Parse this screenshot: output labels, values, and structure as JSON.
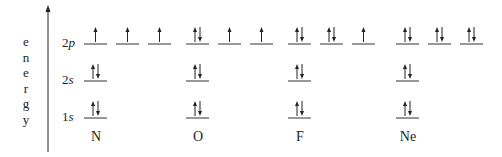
{
  "axis_label": [
    "e",
    "n",
    "e",
    "r",
    "g",
    "y"
  ],
  "levels": [
    {
      "num": "2",
      "sub": "p",
      "y": 44
    },
    {
      "num": "2",
      "sub": "s",
      "y": 81
    },
    {
      "num": "1",
      "sub": "s",
      "y": 118
    }
  ],
  "elements": [
    {
      "symbol": "N",
      "x": 84,
      "config": {
        "1s": [
          "ud"
        ],
        "2s": [
          "ud"
        ],
        "2p": [
          "u",
          "u",
          "u"
        ]
      }
    },
    {
      "symbol": "O",
      "x": 186,
      "config": {
        "1s": [
          "ud"
        ],
        "2s": [
          "ud"
        ],
        "2p": [
          "ud",
          "u",
          "u"
        ]
      }
    },
    {
      "symbol": "F",
      "x": 288,
      "config": {
        "1s": [
          "ud"
        ],
        "2s": [
          "ud"
        ],
        "2p": [
          "ud",
          "ud",
          "u"
        ]
      }
    },
    {
      "symbol": "Ne",
      "x": 396,
      "config": {
        "1s": [
          "ud"
        ],
        "2s": [
          "ud"
        ],
        "2p": [
          "ud",
          "ud",
          "ud"
        ]
      }
    }
  ],
  "colors": {
    "line": "#333333",
    "text": "#222222"
  }
}
